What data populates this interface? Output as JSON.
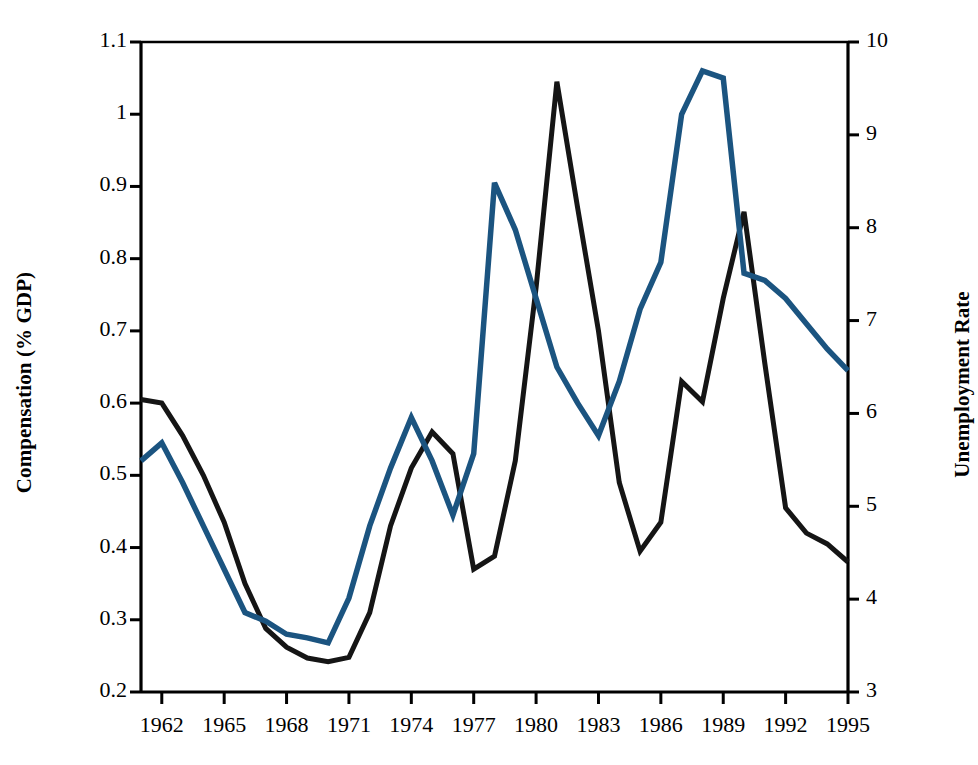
{
  "chart_data": {
    "type": "line",
    "title": "",
    "subtitle": "",
    "xlabel": "",
    "ylabel": "Compensation (% GDP)",
    "y2label": "Unemployment Rate",
    "grid": false,
    "legend": "none",
    "xlim": [
      1961,
      1995
    ],
    "ylim": [
      0.2,
      1.1
    ],
    "y2lim": [
      3,
      10
    ],
    "x_ticks": [
      1962,
      1965,
      1968,
      1971,
      1974,
      1977,
      1980,
      1983,
      1986,
      1989,
      1992,
      1995
    ],
    "y_ticks": [
      "0.2",
      "0.3",
      "0.4",
      "0.5",
      "0.6",
      "0.7",
      "0.8",
      "0.9",
      "1",
      "1.1"
    ],
    "y2_ticks": [
      "3",
      "4",
      "5",
      "6",
      "7",
      "8",
      "9",
      "10"
    ],
    "x": [
      1961,
      1962,
      1963,
      1964,
      1965,
      1966,
      1967,
      1968,
      1969,
      1970,
      1971,
      1972,
      1973,
      1974,
      1975,
      1976,
      1977,
      1978,
      1979,
      1980,
      1981,
      1982,
      1983,
      1984,
      1985,
      1986,
      1987,
      1988,
      1989,
      1990,
      1991,
      1992,
      1993,
      1994,
      1995
    ],
    "series": [
      {
        "name": "Compensation (% GDP)",
        "axis": "left",
        "color": "#1b5480",
        "units": "% GDP",
        "values": [
          0.52,
          0.545,
          0.49,
          0.43,
          0.37,
          0.31,
          0.298,
          0.28,
          0.275,
          0.268,
          0.33,
          0.43,
          0.51,
          0.58,
          0.52,
          0.445,
          0.53,
          0.905,
          0.84,
          0.745,
          0.65,
          0.6,
          0.555,
          0.63,
          0.73,
          0.795,
          1.0,
          1.06,
          1.05,
          0.78,
          0.77,
          0.745,
          0.71,
          0.675,
          0.645
        ]
      },
      {
        "name": "Unemployment Rate",
        "axis": "right",
        "color": "#151515",
        "units": "percent",
        "values": [
          0.605,
          0.6,
          0.555,
          0.5,
          0.435,
          0.35,
          0.288,
          0.262,
          0.247,
          0.242,
          0.248,
          0.31,
          0.43,
          0.51,
          0.56,
          0.53,
          0.37,
          0.388,
          0.52,
          0.76,
          1.045,
          0.87,
          0.7,
          0.49,
          0.395,
          0.435,
          0.63,
          0.602,
          0.745,
          0.865,
          0.655,
          0.455,
          0.42,
          0.405,
          0.38
        ]
      }
    ],
    "series_right_axis_values": {
      "note": "Unemployment Rate values read against the right-hand axis (3-10).",
      "values": [
        6.2,
        6.1,
        5.8,
        5.4,
        4.8,
        4.2,
        3.7,
        3.5,
        3.4,
        3.3,
        3.4,
        3.9,
        4.8,
        5.4,
        5.8,
        5.6,
        4.3,
        4.5,
        5.5,
        7.4,
        9.6,
        8.2,
        7.0,
        5.3,
        4.5,
        4.8,
        6.4,
        6.1,
        7.2,
        8.1,
        6.6,
        5.0,
        4.7,
        4.6,
        4.4
      ]
    },
    "series_left_axis_values": {
      "note": "Compensation values read against the left-hand axis (0.2-1.1).",
      "values": [
        0.52,
        0.545,
        0.49,
        0.43,
        0.37,
        0.31,
        0.298,
        0.28,
        0.275,
        0.268,
        0.33,
        0.43,
        0.51,
        0.58,
        0.52,
        0.445,
        0.53,
        0.905,
        0.84,
        0.745,
        0.65,
        0.6,
        0.555,
        0.63,
        0.73,
        0.795,
        1.0,
        1.06,
        1.05,
        0.78,
        0.77,
        0.745,
        0.71,
        0.675,
        0.645
      ]
    }
  },
  "axes": {
    "left_title": "Compensation (% GDP)",
    "right_title": "Unemployment Rate"
  },
  "colors": {
    "compensation_line": "#1b5480",
    "unemployment_line": "#151515",
    "axis": "#000000",
    "background": "#ffffff"
  }
}
